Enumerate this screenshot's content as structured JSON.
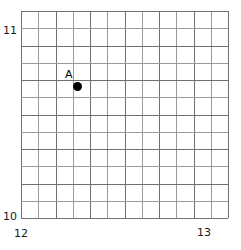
{
  "chart_data": {
    "type": "scatter",
    "title": "",
    "xlabel": "",
    "ylabel": "",
    "xlim": [
      12,
      13
    ],
    "ylim": [
      10,
      11
    ],
    "grid": true,
    "grid_columns": 12,
    "grid_rows": 12,
    "x_tick_labels": [
      "12",
      "13"
    ],
    "y_tick_labels": [
      "10",
      "11"
    ],
    "legend": "none",
    "points": [
      {
        "label": "A",
        "x": 12.27,
        "y": 10.64
      }
    ],
    "series": [
      {
        "name": "A",
        "x": [
          12.27
        ],
        "y": [
          10.64
        ]
      }
    ]
  },
  "axes": {
    "y_top_label": "11",
    "y_bottom_label": "10",
    "x_left_label": "12",
    "x_right_label": "13"
  },
  "point": {
    "label": "A"
  },
  "style": {
    "grid_major_color": "#6f6f6f",
    "grid_minor_color": "#9a9a9a",
    "point_color": "#000000",
    "background": "#ffffff",
    "text_color": "#1a1a1a"
  },
  "geometry": {
    "plot_left": 21,
    "plot_top": 11,
    "plot_width": 207,
    "plot_height": 207,
    "cells_x": 12,
    "cells_y": 12,
    "point_px_x": 77,
    "point_px_y": 86,
    "point_radius": 4.5
  }
}
